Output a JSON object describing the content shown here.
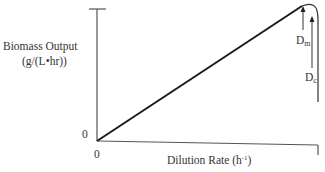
{
  "diagram": {
    "y_axis_label_line1": "Biomass Output",
    "y_axis_label_line2": "(g/(L•hr))",
    "x_axis_label_main": "Dilution Rate (h",
    "x_axis_label_sup": "-1",
    "x_axis_label_close": ")",
    "y_origin_label": "0",
    "x_origin_label": "0",
    "dm_label_main": "D",
    "dm_label_sub": "m",
    "dc_label_main": "D",
    "dc_label_sub": "c",
    "line_color": "#1a1a1a"
  }
}
